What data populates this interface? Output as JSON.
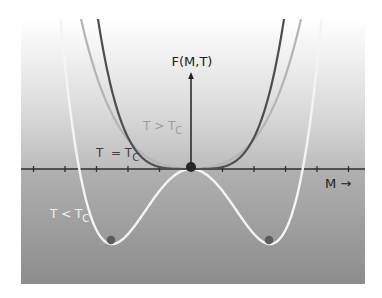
{
  "diagram": {
    "y_axis_label": "F(M,T)",
    "x_axis_label": "M",
    "x_axis_arrow": "→",
    "curves": [
      {
        "name": "T > Tc",
        "label_main": "T > T",
        "label_sub": "C",
        "color": "#b4b4b4",
        "form": "b*M^2 + c*M^4"
      },
      {
        "name": "T = Tc",
        "label_main": "T  = T",
        "label_sub": "C",
        "color": "#505050",
        "form": "c*M^4"
      },
      {
        "name": "T < Tc",
        "label_main": "T < T",
        "label_sub": "C",
        "color": "#f4f4f4",
        "form": "-b*M^2 + c*M^4"
      }
    ],
    "points": [
      {
        "name": "origin-equilibrium",
        "color": "#2a2a2a"
      },
      {
        "name": "left-minimum",
        "color": "#5a5a5a"
      },
      {
        "name": "right-minimum",
        "color": "#5a5a5a"
      }
    ],
    "colors": {
      "panel_top": "#ffffff",
      "panel_mid": "#c8c8c8",
      "panel_bottom": "#8e8e8e",
      "axis": "#2f2f2f",
      "label_dark": "#222222",
      "label_gray": "#9a9a9a",
      "label_white": "#f2f2f2"
    }
  }
}
